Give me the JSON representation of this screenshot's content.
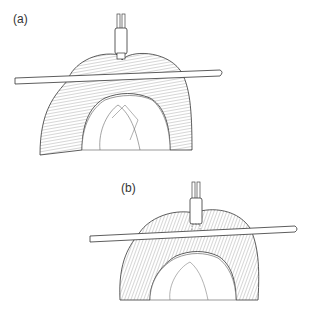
{
  "figure": {
    "panels": [
      {
        "label": "(a)",
        "description": "Bowel loop held over a rod with instrument tip above the fold"
      },
      {
        "label": "(b)",
        "description": "Bowel loop held over a rod with instrument inserted into the fold"
      }
    ],
    "colors": {
      "line": "#333333",
      "hatch": "#777777",
      "background": "#ffffff"
    }
  }
}
